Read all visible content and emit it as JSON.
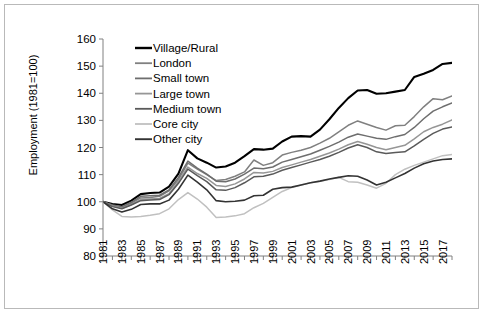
{
  "chart_data": {
    "type": "line",
    "title": "",
    "xlabel": "",
    "ylabel": "Employment (1981=100)",
    "ylim": [
      80,
      160
    ],
    "yticks": [
      80,
      90,
      100,
      110,
      120,
      130,
      140,
      150,
      160
    ],
    "xlim": [
      1981,
      2018
    ],
    "xticks": [
      1981,
      1983,
      1985,
      1987,
      1989,
      1991,
      1993,
      1995,
      1997,
      1999,
      2001,
      2003,
      2005,
      2007,
      2009,
      2011,
      2013,
      2015,
      2017
    ],
    "x": [
      1981,
      1982,
      1983,
      1984,
      1985,
      1986,
      1987,
      1988,
      1989,
      1990,
      1991,
      1992,
      1993,
      1994,
      1995,
      1996,
      1997,
      1998,
      1999,
      2000,
      2001,
      2002,
      2003,
      2004,
      2005,
      2006,
      2007,
      2008,
      2009,
      2010,
      2011,
      2012,
      2013,
      2014,
      2015,
      2016,
      2017,
      2018
    ],
    "grid": false,
    "legend_position": "top-left-inside",
    "series": [
      {
        "name": "Village/Rural",
        "color": "#000000",
        "width": 2.1,
        "values": [
          100,
          99.2,
          98.8,
          100.4,
          102.8,
          103.2,
          103.4,
          105.6,
          110.4,
          119.0,
          116.0,
          114.4,
          112.6,
          113.0,
          114.4,
          116.8,
          119.4,
          119.2,
          119.6,
          122.2,
          124.0,
          124.2,
          124.0,
          126.6,
          130.4,
          134.6,
          138.2,
          141.0,
          141.2,
          139.8,
          140.0,
          140.6,
          141.2,
          146.0,
          147.2,
          148.6,
          150.8,
          151.2
        ]
      },
      {
        "name": "London",
        "color": "#808080",
        "width": 1.5,
        "values": [
          100,
          98.6,
          98.0,
          99.4,
          101.4,
          101.6,
          102.0,
          104.0,
          108.2,
          114.2,
          112.0,
          110.0,
          107.8,
          108.2,
          109.4,
          111.0,
          115.4,
          113.4,
          114.4,
          117.2,
          118.2,
          119.0,
          120.0,
          121.6,
          123.4,
          125.8,
          128.2,
          129.8,
          128.6,
          127.4,
          126.4,
          128.0,
          128.2,
          131.4,
          135.0,
          138.0,
          137.6,
          139.0
        ]
      },
      {
        "name": "Small town",
        "color": "#6e6e6e",
        "width": 1.5,
        "values": [
          100,
          98.8,
          98.2,
          99.8,
          102.0,
          102.2,
          102.4,
          104.4,
          109.0,
          115.0,
          112.4,
          110.2,
          107.6,
          107.4,
          108.4,
          110.2,
          112.4,
          112.2,
          112.8,
          114.6,
          115.6,
          116.6,
          117.6,
          119.0,
          120.4,
          122.0,
          123.8,
          125.0,
          124.2,
          123.4,
          123.0,
          124.0,
          124.8,
          127.4,
          130.6,
          133.4,
          135.0,
          136.4
        ]
      },
      {
        "name": "Large town",
        "color": "#969696",
        "width": 1.5,
        "values": [
          100,
          98.4,
          97.6,
          99.0,
          100.8,
          101.0,
          101.2,
          103.0,
          107.4,
          112.8,
          110.4,
          108.6,
          106.0,
          105.6,
          106.6,
          108.4,
          110.8,
          110.6,
          111.2,
          112.6,
          113.6,
          114.6,
          115.6,
          116.8,
          118.0,
          119.4,
          121.0,
          122.2,
          121.2,
          120.0,
          119.2,
          120.0,
          120.8,
          123.2,
          125.8,
          127.4,
          128.6,
          130.2
        ]
      },
      {
        "name": "Medium town",
        "color": "#5a5a5a",
        "width": 1.5,
        "values": [
          100,
          98.2,
          97.4,
          98.8,
          100.4,
          100.6,
          100.8,
          102.6,
          106.8,
          112.0,
          109.6,
          107.4,
          104.4,
          104.2,
          105.2,
          107.0,
          109.2,
          109.4,
          110.2,
          111.6,
          112.6,
          113.6,
          114.6,
          115.6,
          116.8,
          118.2,
          119.8,
          121.0,
          120.0,
          118.4,
          117.8,
          118.2,
          118.4,
          120.6,
          123.0,
          125.2,
          126.8,
          127.6
        ]
      },
      {
        "name": "Core city",
        "color": "#c0c0c0",
        "width": 1.5,
        "values": [
          100,
          97.0,
          94.6,
          94.4,
          94.6,
          95.0,
          95.6,
          97.4,
          100.8,
          103.4,
          101.0,
          98.0,
          94.2,
          94.4,
          94.8,
          95.6,
          97.8,
          99.4,
          101.6,
          103.8,
          105.2,
          106.2,
          107.0,
          107.6,
          108.2,
          109.0,
          107.4,
          107.2,
          106.2,
          105.0,
          106.8,
          110.0,
          112.0,
          113.4,
          114.6,
          115.8,
          117.0,
          117.4
        ]
      },
      {
        "name": "Other city",
        "color": "#333333",
        "width": 1.6,
        "values": [
          100,
          97.4,
          96.2,
          97.2,
          99.0,
          99.2,
          99.2,
          100.6,
          104.6,
          109.8,
          107.2,
          104.4,
          100.4,
          100.0,
          100.2,
          100.6,
          102.2,
          102.4,
          104.6,
          105.2,
          105.4,
          106.2,
          107.0,
          107.6,
          108.4,
          109.0,
          109.6,
          109.4,
          108.0,
          106.2,
          107.2,
          108.8,
          110.4,
          112.4,
          114.0,
          115.0,
          115.6,
          115.8
        ]
      }
    ]
  },
  "legend": {
    "items": [
      {
        "label": "Village/Rural"
      },
      {
        "label": "London"
      },
      {
        "label": "Small town"
      },
      {
        "label": "Large town"
      },
      {
        "label": "Medium town"
      },
      {
        "label": "Core city"
      },
      {
        "label": "Other city"
      }
    ]
  }
}
